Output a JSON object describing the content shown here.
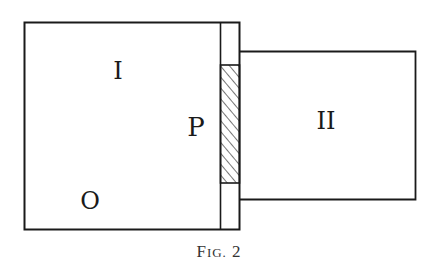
{
  "figure": {
    "caption_prefix": "F",
    "caption_smallcaps": "IG.",
    "caption_number": "2",
    "labels": {
      "region_one": "I",
      "partition": "P",
      "point": "O",
      "region_two": "II"
    },
    "colors": {
      "ink": "#1a1a1a",
      "background": "#ffffff"
    }
  }
}
